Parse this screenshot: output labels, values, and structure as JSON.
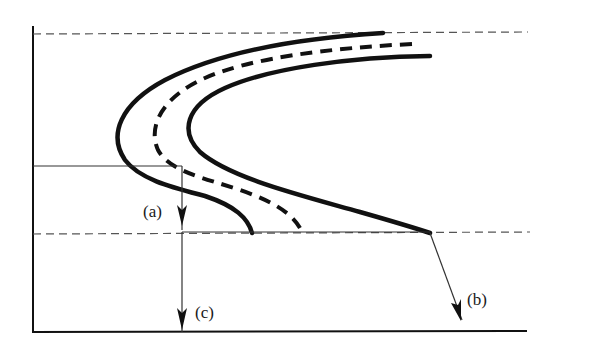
{
  "diagram": {
    "type": "schematic curve diagram",
    "colors": {
      "background": "#ffffff",
      "stroke": "#111111",
      "thin_line": "#333333",
      "dashed_guide": "#555555"
    },
    "labels": {
      "a": "(a)",
      "b": "(b)",
      "c": "(c)"
    },
    "elements": {
      "axes": "left vertical axis and bottom horizontal axis",
      "guides": [
        "top dashed horizontal line",
        "bottom dashed horizontal line"
      ],
      "curves": [
        "outer solid C-shaped curve",
        "middle dashed C-shaped curve",
        "inner solid C-shaped curve"
      ],
      "arrows": [
        {
          "label": "(a)",
          "direction": "down",
          "description": "short arrow from horizontal line to bottom dashed line"
        },
        {
          "label": "(c)",
          "direction": "down",
          "description": "long arrow continuing to bottom axis"
        },
        {
          "label": "(b)",
          "direction": "down-right",
          "description": "oblique arrow from end of inner curve"
        }
      ]
    }
  }
}
